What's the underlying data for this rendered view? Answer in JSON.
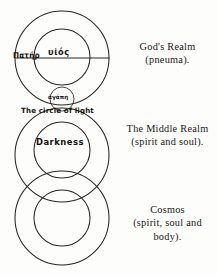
{
  "diagram": {
    "title_alt": "Three-realm concentric circle diagram",
    "inner_labels": {
      "pater": "Πατήρ",
      "huios": "υἱός",
      "agape": "ἀγάπη",
      "circle_of_light": "The circle of light",
      "darkness": "Darkness"
    },
    "stroke_color": "#2a2724",
    "background_color": "#fdfdfc",
    "circles": [
      {
        "name": "gods-realm-outer",
        "cx": 62,
        "cy": 58,
        "r": 47
      },
      {
        "name": "gods-realm-inner",
        "cx": 62,
        "cy": 57,
        "r": 28
      },
      {
        "name": "agape-circle",
        "cx": 62,
        "cy": 99,
        "r": 12
      },
      {
        "name": "middle-realm-outer",
        "cx": 62,
        "cy": 155,
        "r": 47
      },
      {
        "name": "middle-realm-inner",
        "cx": 62,
        "cy": 150,
        "r": 28
      },
      {
        "name": "cosmos-outer",
        "cx": 62,
        "cy": 218,
        "r": 47
      },
      {
        "name": "cosmos-inner",
        "cx": 62,
        "cy": 218,
        "r": 28
      }
    ],
    "diameter_line": {
      "name": "gods-realm-diameter",
      "x1": 15,
      "y1": 58,
      "x2": 109,
      "y2": 58
    }
  },
  "captions": [
    {
      "name": "gods-realm",
      "lines": [
        "God's Realm",
        "(pneuma)."
      ]
    },
    {
      "name": "middle-realm",
      "lines": [
        "The Middle Realm",
        "(spirit and soul)."
      ]
    },
    {
      "name": "cosmos",
      "lines": [
        "Cosmos",
        "(spirit, soul and",
        "body)."
      ]
    }
  ]
}
